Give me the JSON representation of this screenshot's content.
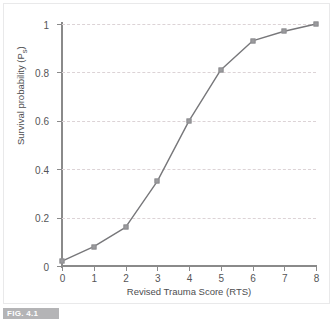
{
  "figure": {
    "caption_label": "FIG. 4.1"
  },
  "chart_data": {
    "type": "line",
    "title": "",
    "xlabel": "Revised Trauma Score (RTS)",
    "ylabel": "Survival probability (Ps)",
    "ylabel_main": "Survival probability (P",
    "ylabel_sub": "s",
    "ylabel_close": ")",
    "x": [
      0,
      1,
      2,
      3,
      4,
      5,
      6,
      7,
      8
    ],
    "values": [
      0.02,
      0.08,
      0.16,
      0.35,
      0.6,
      0.81,
      0.93,
      0.97,
      1.0
    ],
    "xlim": [
      0,
      8
    ],
    "ylim": [
      0,
      1
    ],
    "xticks": [
      0,
      1,
      2,
      3,
      4,
      5,
      6,
      7,
      8
    ],
    "xtick_labels": [
      "0",
      "1",
      "2",
      "3",
      "4",
      "5",
      "6",
      "7",
      "8"
    ],
    "yticks": [
      0,
      0.2,
      0.4,
      0.6,
      0.8,
      1
    ],
    "ytick_labels": [
      "0",
      "0.2",
      "0.4",
      "0.6",
      "0.8",
      "1"
    ],
    "grid": "horizontal-dashed",
    "legend": "none",
    "marker": "square",
    "line_color": "#77777a",
    "marker_color": "#9b9b9e",
    "grid_color": "#dcd3d6",
    "axis_color": "#8a8a8a",
    "text_color": "#555557"
  }
}
